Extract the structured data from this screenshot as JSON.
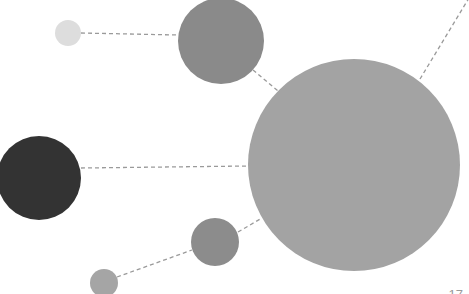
{
  "diagram": {
    "type": "bubble-network",
    "nodes": [
      {
        "id": "small-light",
        "cx": 68,
        "cy": 33,
        "r": 13,
        "color": "#dddddd"
      },
      {
        "id": "medium-top",
        "cx": 221,
        "cy": 41,
        "r": 43,
        "color": "#8a8a8a"
      },
      {
        "id": "large-center",
        "cx": 354,
        "cy": 165,
        "r": 106,
        "color": "#a3a3a3"
      },
      {
        "id": "dark-left",
        "cx": 39,
        "cy": 178,
        "r": 42,
        "color": "#333333"
      },
      {
        "id": "medium-bottom",
        "cx": 215,
        "cy": 242,
        "r": 24,
        "color": "#8c8c8c"
      },
      {
        "id": "small-bottom",
        "cx": 104,
        "cy": 283,
        "r": 14,
        "color": "#a5a5a5"
      }
    ],
    "edges": [
      {
        "from": "small-light",
        "to": "medium-top"
      },
      {
        "from": "medium-top",
        "to": "large-center"
      },
      {
        "from": "dark-left",
        "to": "large-center"
      },
      {
        "from": "small-bottom",
        "to": "medium-bottom"
      },
      {
        "from": "medium-bottom",
        "to": "large-center"
      },
      {
        "from": "large-center",
        "to": "offscreen-top-right"
      }
    ],
    "line_color": "#9a9a9a"
  },
  "page_number": "17"
}
